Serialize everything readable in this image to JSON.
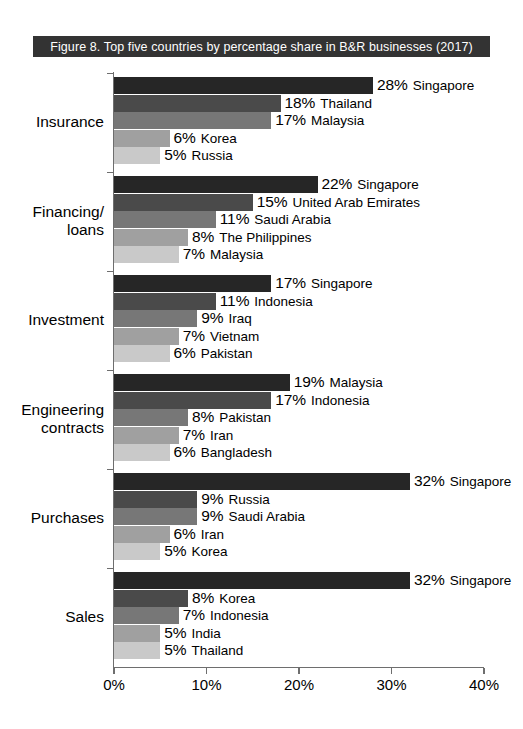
{
  "title": "Figure 8.  Top five countries by percentage share in B&R businesses (2017)",
  "colors": {
    "banner_background": "#333333",
    "banner_text": "#ffffff",
    "axis": "#6e6e6e",
    "bar_ranks": [
      "#262626",
      "#4a4a4a",
      "#777777",
      "#a0a0a0",
      "#c9c9c9"
    ]
  },
  "chart_data": {
    "type": "bar",
    "orientation": "horizontal",
    "title": "Figure 8.  Top five countries by percentage share in B&R businesses (2017)",
    "xlabel": "",
    "ylabel": "",
    "xlim": [
      0,
      40
    ],
    "xticks": [
      0,
      10,
      20,
      30,
      40
    ],
    "xtick_labels": [
      "0%",
      "10%",
      "20%",
      "30%",
      "40%"
    ],
    "grid": false,
    "legend": "none",
    "value_unit": "%",
    "categories": [
      "Insurance",
      "Financing/\nloans",
      "Investment",
      "Engineering\ncontracts",
      "Purchases",
      "Sales"
    ],
    "groups": [
      {
        "category": "Insurance",
        "bars": [
          {
            "value": 28,
            "value_label": "28%",
            "country": "Singapore"
          },
          {
            "value": 18,
            "value_label": "18%",
            "country": "Thailand"
          },
          {
            "value": 17,
            "value_label": "17%",
            "country": "Malaysia"
          },
          {
            "value": 6,
            "value_label": "6%",
            "country": "Korea"
          },
          {
            "value": 5,
            "value_label": "5%",
            "country": "Russia"
          }
        ]
      },
      {
        "category": "Financing/\nloans",
        "bars": [
          {
            "value": 22,
            "value_label": "22%",
            "country": "Singapore"
          },
          {
            "value": 15,
            "value_label": "15%",
            "country": "United Arab Emirates"
          },
          {
            "value": 11,
            "value_label": "11%",
            "country": "Saudi Arabia"
          },
          {
            "value": 8,
            "value_label": "8%",
            "country": "The Philippines"
          },
          {
            "value": 7,
            "value_label": "7%",
            "country": "Malaysia"
          }
        ]
      },
      {
        "category": "Investment",
        "bars": [
          {
            "value": 17,
            "value_label": "17%",
            "country": "Singapore"
          },
          {
            "value": 11,
            "value_label": "11%",
            "country": "Indonesia"
          },
          {
            "value": 9,
            "value_label": "9%",
            "country": "Iraq"
          },
          {
            "value": 7,
            "value_label": "7%",
            "country": "Vietnam"
          },
          {
            "value": 6,
            "value_label": "6%",
            "country": "Pakistan"
          }
        ]
      },
      {
        "category": "Engineering\ncontracts",
        "bars": [
          {
            "value": 19,
            "value_label": "19%",
            "country": "Malaysia"
          },
          {
            "value": 17,
            "value_label": "17%",
            "country": "Indonesia"
          },
          {
            "value": 8,
            "value_label": "8%",
            "country": "Pakistan"
          },
          {
            "value": 7,
            "value_label": "7%",
            "country": "Iran"
          },
          {
            "value": 6,
            "value_label": "6%",
            "country": "Bangladesh"
          }
        ]
      },
      {
        "category": "Purchases",
        "bars": [
          {
            "value": 32,
            "value_label": "32%",
            "country": "Singapore"
          },
          {
            "value": 9,
            "value_label": "9%",
            "country": "Russia"
          },
          {
            "value": 9,
            "value_label": "9%",
            "country": "Saudi Arabia"
          },
          {
            "value": 6,
            "value_label": "6%",
            "country": "Iran"
          },
          {
            "value": 5,
            "value_label": "5%",
            "country": "Korea"
          }
        ]
      },
      {
        "category": "Sales",
        "bars": [
          {
            "value": 32,
            "value_label": "32%",
            "country": "Singapore"
          },
          {
            "value": 8,
            "value_label": "8%",
            "country": "Korea"
          },
          {
            "value": 7,
            "value_label": "7%",
            "country": "Indonesia"
          },
          {
            "value": 5,
            "value_label": "5%",
            "country": "India"
          },
          {
            "value": 5,
            "value_label": "5%",
            "country": "Thailand"
          }
        ]
      }
    ]
  }
}
